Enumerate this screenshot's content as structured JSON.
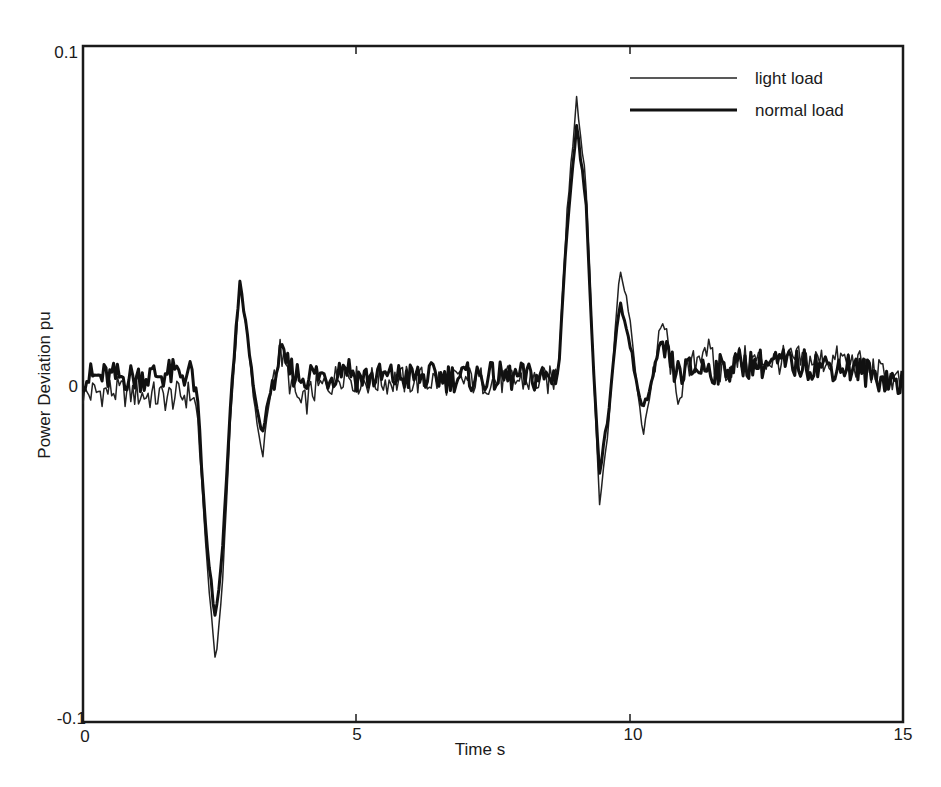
{
  "chart_data": {
    "type": "line",
    "title": "",
    "xlabel": "Time s",
    "ylabel": "Power Deviation pu",
    "xlim": [
      0,
      15
    ],
    "ylim": [
      -0.1,
      0.1
    ],
    "grid": false,
    "legend_position": "upper right (inside)",
    "x_ticks": [
      0,
      5,
      10,
      15
    ],
    "x_tick_labels": [
      "0",
      "5",
      "10",
      "15"
    ],
    "y_ticks": [
      -0.1,
      0,
      0.1
    ],
    "y_tick_labels": [
      "-0.1",
      "0",
      "0.1"
    ],
    "series": [
      {
        "name": "light load",
        "style": "thin",
        "color": "#222222",
        "x": [
          0,
          0.5,
          1.0,
          1.5,
          2.0,
          2.1,
          2.25,
          2.42,
          2.55,
          2.7,
          2.87,
          3.0,
          3.15,
          3.28,
          3.45,
          3.6,
          3.8,
          4.0,
          4.2,
          4.5,
          4.8,
          5.0,
          6.0,
          7.0,
          8.0,
          8.6,
          8.7,
          8.85,
          9.03,
          9.2,
          9.35,
          9.45,
          9.6,
          9.82,
          10.0,
          10.24,
          10.45,
          10.62,
          10.85,
          11.1,
          11.38,
          11.6,
          12.0,
          13.0,
          14.0,
          15.0
        ],
        "y": [
          -0.003,
          -0.002,
          -0.003,
          -0.004,
          -0.003,
          -0.01,
          -0.05,
          -0.0825,
          -0.06,
          -0.01,
          0.03,
          0.015,
          -0.008,
          -0.0217,
          0.0,
          0.01,
          0.0,
          -0.007,
          -0.002,
          0.0,
          0.004,
          0.001,
          0.001,
          0.001,
          0.001,
          0.001,
          0.004,
          0.05,
          0.0843,
          0.06,
          0.0,
          -0.035,
          -0.015,
          0.035,
          0.02,
          -0.0157,
          0.005,
          0.0187,
          -0.0036,
          0.004,
          0.012,
          0.003,
          0.007,
          0.007,
          0.007,
          0.0
        ]
      },
      {
        "name": "normal load",
        "style": "thick",
        "color": "#111111",
        "x": [
          0,
          0.5,
          1.0,
          1.5,
          2.0,
          2.1,
          2.25,
          2.42,
          2.55,
          2.7,
          2.87,
          3.0,
          3.15,
          3.28,
          3.45,
          3.6,
          3.8,
          4.0,
          4.2,
          4.5,
          4.8,
          5.0,
          6.0,
          7.0,
          8.0,
          8.6,
          8.7,
          8.85,
          9.03,
          9.2,
          9.35,
          9.45,
          9.6,
          9.82,
          10.0,
          10.24,
          10.45,
          10.62,
          10.85,
          11.1,
          11.38,
          11.6,
          12.0,
          13.0,
          14.0,
          15.0
        ],
        "y": [
          0.002,
          0.002,
          0.002,
          0.003,
          0.003,
          -0.005,
          -0.045,
          -0.07,
          -0.05,
          -0.005,
          0.031,
          0.015,
          -0.005,
          -0.014,
          0.0,
          0.008,
          0.004,
          0.002,
          0.003,
          0.002,
          0.006,
          0.002,
          0.002,
          0.002,
          0.002,
          0.002,
          0.004,
          0.045,
          0.0757,
          0.055,
          0.0,
          -0.026,
          -0.01,
          0.0246,
          0.012,
          -0.0083,
          0.003,
          0.0104,
          0.003,
          0.004,
          0.005,
          0.004,
          0.006,
          0.006,
          0.005,
          0.0
        ]
      }
    ]
  },
  "legend": {
    "items": [
      {
        "label": "light load",
        "style": "thin"
      },
      {
        "label": "normal load",
        "style": "thick"
      }
    ]
  },
  "axes": {
    "xlabel": "Time s",
    "ylabel": "Power Deviation pu",
    "y_top": "0.1",
    "y_mid": "0",
    "y_bottom": "-0.1",
    "x0": "0",
    "x5": "5",
    "x10": "10",
    "x15": "15"
  },
  "colors": {
    "axis": "#1a1a1a",
    "background": "#ffffff",
    "line": "#1a1a1a"
  }
}
